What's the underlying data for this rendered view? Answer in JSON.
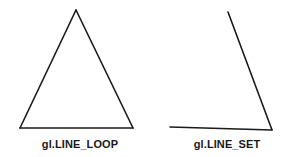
{
  "canvas": {
    "width": 300,
    "height": 157,
    "background_color": "#ffffff",
    "stroke_color": "#1a1a1a",
    "stroke_width": 1.6
  },
  "figures": [
    {
      "id": "line-loop",
      "caption": "gl.LINE_LOOP",
      "description": "closed triangle outline",
      "vertices": [
        {
          "x": 76,
          "y": 10
        },
        {
          "x": 133,
          "y": 128
        },
        {
          "x": 20,
          "y": 128
        }
      ],
      "segments": [
        {
          "x1": 76,
          "y1": 10,
          "x2": 133,
          "y2": 128
        },
        {
          "x1": 133,
          "y1": 128,
          "x2": 20,
          "y2": 128
        },
        {
          "x1": 20,
          "y1": 128,
          "x2": 76,
          "y2": 10
        }
      ]
    },
    {
      "id": "line-set",
      "caption": "gl.LINE_SET",
      "description": "two disconnected line segments forming an open angle",
      "vertices": [
        {
          "x": 228,
          "y": 12
        },
        {
          "x": 272,
          "y": 130
        },
        {
          "x": 170,
          "y": 127
        }
      ],
      "segments": [
        {
          "x1": 228,
          "y1": 12,
          "x2": 272,
          "y2": 130
        },
        {
          "x1": 272,
          "y1": 130,
          "x2": 170,
          "y2": 127
        }
      ]
    }
  ]
}
